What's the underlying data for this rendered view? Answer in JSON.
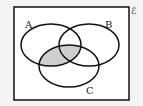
{
  "diagram": {
    "type": "venn",
    "universal_label": "ℰ",
    "sets": [
      {
        "label": "A"
      },
      {
        "label": "B"
      },
      {
        "label": "C"
      }
    ],
    "shaded_region": "A ∩ C",
    "shade_color": "#cfcfcf",
    "line_color": "#111111",
    "background": "#ffffff"
  }
}
